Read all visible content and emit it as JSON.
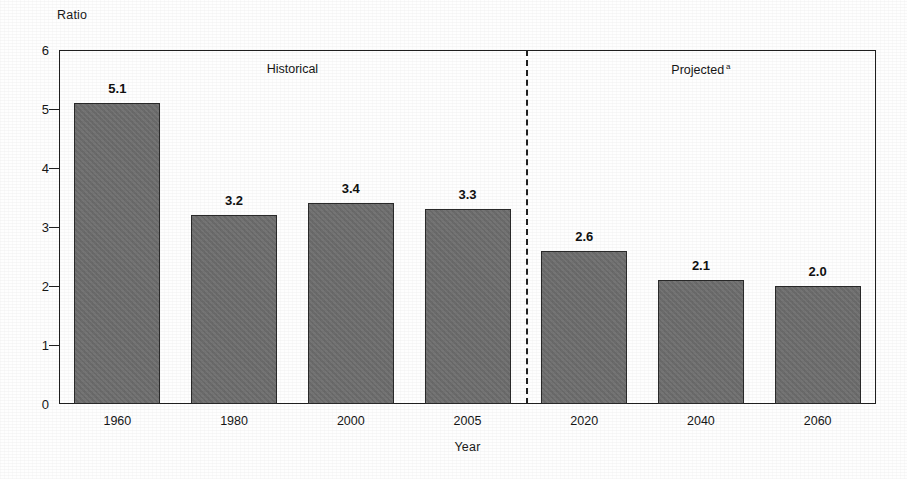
{
  "chart_data": {
    "type": "bar",
    "title": "",
    "xlabel": "Year",
    "ylabel": "Ratio",
    "categories": [
      "1960",
      "1980",
      "2000",
      "2005",
      "2020",
      "2040",
      "2060"
    ],
    "values": [
      5.1,
      3.2,
      3.4,
      3.3,
      2.6,
      2.1,
      2.0
    ],
    "value_labels": [
      "5.1",
      "3.2",
      "3.4",
      "3.3",
      "2.6",
      "2.1",
      "2.0"
    ],
    "ylim": [
      0,
      6
    ],
    "ytick_labels": [
      "0",
      "1",
      "2",
      "3",
      "4",
      "5",
      "6"
    ],
    "yticks": [
      0,
      1,
      2,
      3,
      4,
      5,
      6
    ],
    "grid": false,
    "legend": false,
    "bar_color": "#6f6f6f",
    "bar_edge_color": "#2a2a2a",
    "annotations": [
      {
        "name": "historical-period",
        "text": "Historical",
        "superscript": "",
        "center_category_index": 1.5
      },
      {
        "name": "projected-period",
        "text": "Projected",
        "superscript": "a",
        "center_category_index": 5.0
      }
    ],
    "divider": {
      "name": "historical-projected-divider",
      "style": "dashed",
      "between_categories": [
        "2005",
        "2020"
      ]
    }
  },
  "axes": {
    "y_title": "Ratio",
    "x_title": "Year"
  }
}
